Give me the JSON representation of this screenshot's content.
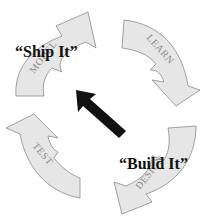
{
  "diagram": {
    "type": "cycle",
    "stages": [
      {
        "id": "model",
        "label": "MODEL",
        "position": "top-left"
      },
      {
        "id": "learn",
        "label": "LEARN",
        "position": "top-right"
      },
      {
        "id": "design",
        "label": "DESIGN",
        "position": "bottom-right"
      },
      {
        "id": "test",
        "label": "TEST",
        "position": "bottom-left"
      }
    ],
    "direction": "clockwise",
    "annotations": {
      "ship_it": "“Ship It”",
      "build_it": "“Build It”"
    },
    "center_arrow": {
      "direction": "up-left",
      "from": "DESIGN",
      "to": "MODEL",
      "color": "#111111"
    },
    "colors": {
      "stage_fill": "#e6e6e6",
      "stage_stroke": "#8a8a8a",
      "stage_text": "#8a8a8a",
      "quote_text": "#111111"
    }
  }
}
